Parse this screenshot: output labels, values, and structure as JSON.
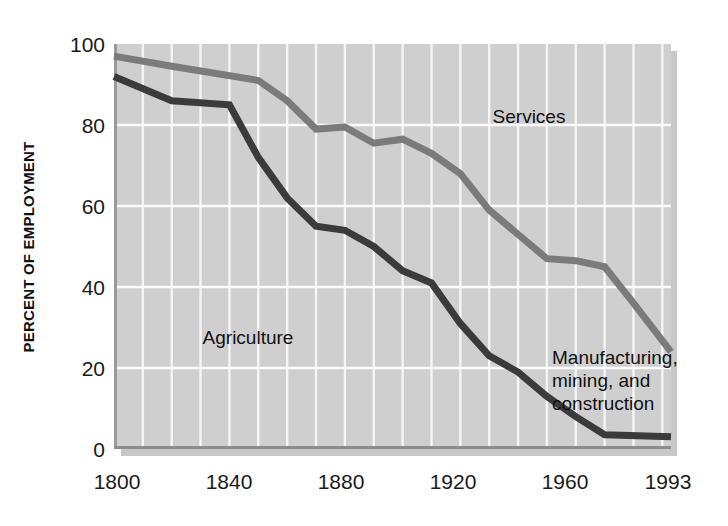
{
  "chart_data": {
    "type": "line",
    "title": "",
    "subtitle": "",
    "xlabel": "",
    "ylabel": "PERCENT OF EMPLOYMENT",
    "xlim": [
      1800,
      1993
    ],
    "ylim": [
      0,
      100
    ],
    "x_tick_labels": [
      "1800",
      "1840",
      "1880",
      "1920",
      "1960",
      "1993"
    ],
    "x_tick_values": [
      1800,
      1840,
      1880,
      1920,
      1960,
      1993
    ],
    "y_tick_labels": [
      "0",
      "20",
      "40",
      "60",
      "80",
      "100"
    ],
    "y_tick_values": [
      0,
      20,
      40,
      60,
      80,
      100
    ],
    "grid": "both",
    "grid_x_step": 10,
    "grid_y_step": 20,
    "legend_position": "inline-annotations",
    "series": [
      {
        "name": "Services",
        "color": "#7b7b7b",
        "stroke_width": 7,
        "label_x": 1888,
        "label_y": 86,
        "x": [
          1800,
          1820,
          1850,
          1860,
          1870,
          1880,
          1890,
          1900,
          1910,
          1920,
          1930,
          1940,
          1950,
          1960,
          1970,
          1980,
          1993
        ],
        "values": [
          97,
          94.5,
          91,
          86,
          79,
          79.5,
          75.5,
          76.5,
          73,
          68,
          59,
          53,
          47,
          46.5,
          45,
          36,
          24
        ]
      },
      {
        "name": "Agriculture",
        "color": "#3b3b3b",
        "stroke_width": 7,
        "label_x": 1845,
        "label_y": 36,
        "x": [
          1800,
          1820,
          1840,
          1850,
          1860,
          1870,
          1880,
          1890,
          1900,
          1910,
          1920,
          1930,
          1940,
          1950,
          1960,
          1970,
          1993
        ],
        "values": [
          92,
          86,
          85,
          72,
          62,
          55,
          54,
          50,
          44,
          41,
          31,
          23,
          19,
          13,
          8,
          3.5,
          3
        ]
      }
    ],
    "annotations": [
      {
        "id": "services-label",
        "text": "Services",
        "x": 1888,
        "y": 86,
        "lines": [
          "Services"
        ]
      },
      {
        "id": "agriculture-label",
        "text": "Agriculture",
        "x": 1845,
        "y": 36,
        "lines": [
          "Agriculture"
        ]
      },
      {
        "id": "manufacturing-label",
        "text": "Manufacturing, mining, and construction",
        "x": 1955,
        "y": 27,
        "lines": [
          "Manufacturing,",
          "mining, and",
          "construction"
        ]
      }
    ]
  },
  "labels": {
    "y_axis_title": "PERCENT OF EMPLOYMENT",
    "services": "Services",
    "agriculture": "Agriculture",
    "manufacturing_line1": "Manufacturing,",
    "manufacturing_line2": "mining, and",
    "manufacturing_line3": "construction",
    "y_100": "100",
    "y_80": "80",
    "y_60": "60",
    "y_40": "40",
    "y_20": "20",
    "y_0": "0",
    "x_1800": "1800",
    "x_1840": "1840",
    "x_1880": "1880",
    "x_1920": "1920",
    "x_1960": "1960",
    "x_1993": "1993"
  },
  "colors": {
    "plot_background": "#cfcfcf",
    "grid": "#f7f7f7",
    "services_line": "#7b7b7b",
    "agriculture_line": "#3b3b3b",
    "text": "#111111",
    "page_background": "#ffffff"
  }
}
